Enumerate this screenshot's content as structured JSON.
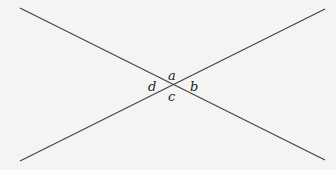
{
  "diagram": {
    "lines": [
      {
        "id": "line-1",
        "from": "top-left",
        "to": "bottom-right"
      },
      {
        "id": "line-2",
        "from": "bottom-left",
        "to": "top-right"
      }
    ],
    "angle_labels": {
      "top": "a",
      "right": "b",
      "bottom": "c",
      "left": "d"
    },
    "colors": {
      "line": "#444444",
      "label": "#222222",
      "background": "#f4f4f3"
    }
  }
}
